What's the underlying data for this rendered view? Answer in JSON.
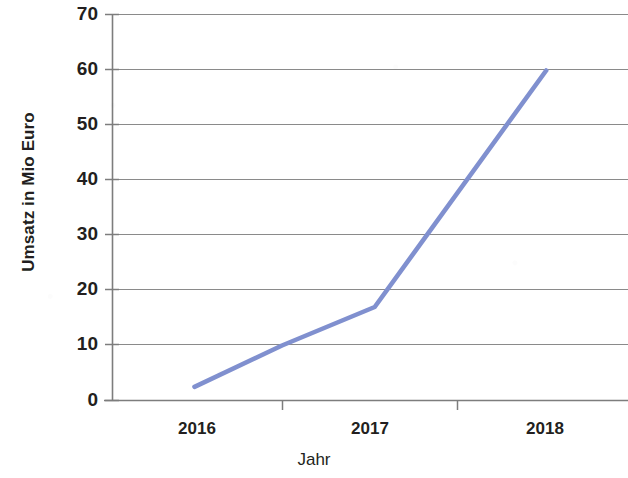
{
  "chart_data": {
    "type": "line",
    "title": "",
    "subtitle": "",
    "xlabel": "Jahr",
    "ylabel": "Umsatz in Mio Euro",
    "x": [
      "2016",
      "2017",
      "2018"
    ],
    "categories": [
      "2016",
      "2017",
      "2018"
    ],
    "series": [
      {
        "name": "Umsatz",
        "color": "#8090cf",
        "points": [
          {
            "x": 2015.5,
            "y": 2.5
          },
          {
            "x": 2016.0,
            "y": 10
          },
          {
            "x": 2016.53,
            "y": 17
          },
          {
            "x": 2017.51,
            "y": 60
          }
        ],
        "values": [
          10,
          40,
          60
        ]
      }
    ],
    "xlim": [
      2015.5,
      2018.5
    ],
    "ylim": [
      0,
      70
    ],
    "yticks": [
      0,
      10,
      20,
      30,
      40,
      50,
      60,
      70
    ],
    "ytick_labels": [
      "0",
      "10",
      "20",
      "30",
      "40",
      "50",
      "60",
      "70"
    ],
    "xticks": [
      2016,
      2017,
      2018
    ],
    "xtick_labels": [
      "2016",
      "2017",
      "2018"
    ],
    "grid": "horizontal",
    "legend": "none",
    "line_color": "#8090cf",
    "axis_color": "#808080",
    "text_color": "#231f20",
    "background": "#ffffff"
  },
  "axes": {
    "y_title": "Umsatz in Mio Euro",
    "x_title": "Jahr",
    "y_tick_labels": [
      "70",
      "60",
      "50",
      "40",
      "30",
      "20",
      "10",
      "0"
    ],
    "x_tick_labels": [
      "2016",
      "2017",
      "2018"
    ]
  }
}
